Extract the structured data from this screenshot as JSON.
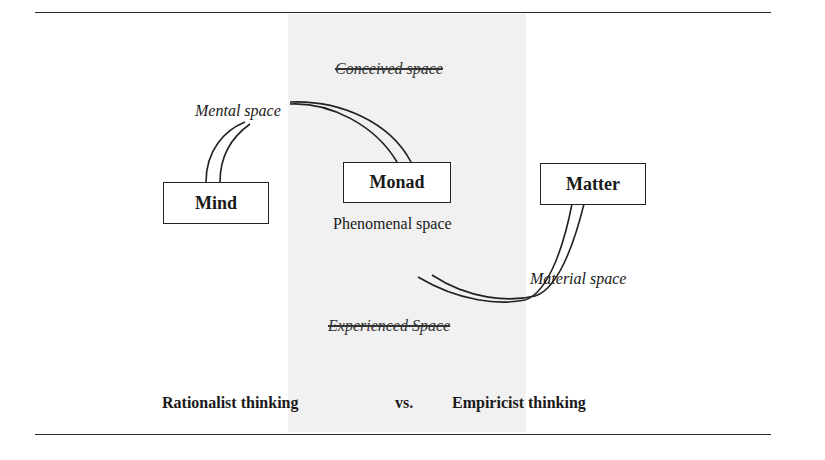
{
  "diagram": {
    "top_label": "Conceived space",
    "bottom_label": "Experienced Space",
    "nodes": {
      "mind": "Mind",
      "monad": "Monad",
      "matter": "Matter"
    },
    "spaces": {
      "mental": "Mental space",
      "phenomenal": "Phenomenal space",
      "material": "Material space"
    },
    "caption": {
      "left": "Rationalist thinking",
      "middle": "vs.",
      "right": "Empiricist thinking"
    }
  }
}
